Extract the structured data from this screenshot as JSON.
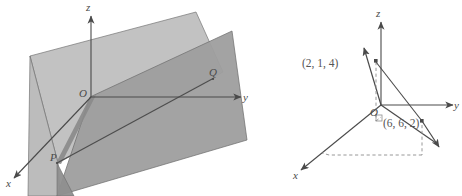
{
  "figure": {
    "caption": "",
    "panels": [
      {
        "id": "left",
        "name": "two-intersecting-planes-diagram",
        "axes": {
          "x": "x",
          "y": "y",
          "z": "z"
        },
        "origin_label": "O",
        "points": [
          {
            "label": "P"
          },
          {
            "label": "Q"
          }
        ],
        "plane_fill_light": "#b9b9b9",
        "plane_fill_dark": "#9a9a9a",
        "plane_stroke": "#6f6f6f",
        "axis_color": "#4a4a4a"
      },
      {
        "id": "right",
        "name": "two-vectors-diagram",
        "axes": {
          "x": "x",
          "y": "y",
          "z": "z"
        },
        "origin_label": "O",
        "vectors": [
          {
            "label": "(2, 1, 4)",
            "components": [
              2,
              1,
              4
            ]
          },
          {
            "label": "(6, 6, 2)",
            "components": [
              6,
              6,
              2
            ]
          }
        ],
        "axis_color": "#4a4a4a",
        "dash_color": "#8d8d8d"
      }
    ]
  }
}
